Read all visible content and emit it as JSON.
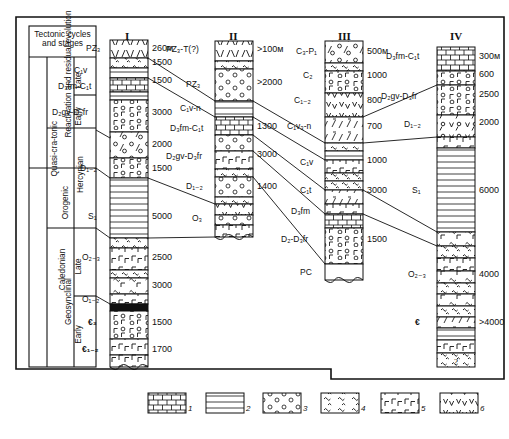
{
  "diagram": {
    "title_box": "Tectonic cycles and stages",
    "tectonic_table": {
      "cycles": [
        {
          "name": "Hercynian"
        },
        {
          "name": "Caledonian"
        }
      ],
      "stages": [
        {
          "name": "Reactivation and residual evolution"
        },
        {
          "name": "Quasi-cra-tonic"
        },
        {
          "name": "Orogenic"
        },
        {
          "name": "Geosynclinal"
        }
      ],
      "substages": [
        "Late",
        "Early",
        "Late",
        "Early"
      ]
    },
    "columns": [
      {
        "header": "I",
        "units": [
          {
            "label": "PZ₃",
            "thickness": "260м"
          },
          {
            "label": "",
            "thickness": "1500"
          },
          {
            "label": "",
            "thickness": "1500"
          },
          {
            "label": "C₁v",
            "thickness": ""
          },
          {
            "label": "D₃fm-C₁t",
            "thickness": ""
          },
          {
            "label": "D₂gv-D₃fr",
            "thickness": "3000"
          },
          {
            "label": "",
            "thickness": "2000"
          },
          {
            "label": "D₁₋₂",
            "thickness": "1500"
          },
          {
            "label": "S₁",
            "thickness": "5000"
          },
          {
            "label": "O₂₋₃",
            "thickness": "2500"
          },
          {
            "label": "O₁₋₂",
            "thickness": "3000"
          },
          {
            "label": "€₃",
            "thickness": "1500"
          },
          {
            "label": "€₁₋₂",
            "thickness": "1700"
          }
        ]
      },
      {
        "header": "II",
        "units": [
          {
            "label": "PZ₃-T(?)",
            "thickness": ">100м"
          },
          {
            "label": "PZ₃",
            "thickness": ">2000"
          },
          {
            "label": "C₁v-n",
            "thickness": ""
          },
          {
            "label": "D₃fm-C₁t",
            "thickness": "1300"
          },
          {
            "label": "D₂gv-D₃fr",
            "thickness": "3000"
          },
          {
            "label": "D₁₋₂",
            "thickness": "1400"
          },
          {
            "label": "O₃",
            "thickness": ""
          }
        ]
      },
      {
        "header": "III",
        "units": [
          {
            "label": "C₃-P₁",
            "thickness": "500м"
          },
          {
            "label": "C₂",
            "thickness": "1000"
          },
          {
            "label": "C₁₋₂",
            "thickness": "800"
          },
          {
            "label": "C₁v₃-n",
            "thickness": "700"
          },
          {
            "label": "C₁v",
            "thickness": "1000"
          },
          {
            "label": "C₁t",
            "thickness": "3000"
          },
          {
            "label": "D₃fm",
            "thickness": ""
          },
          {
            "label": "D₂-D₃fr",
            "thickness": "1500"
          },
          {
            "label": "PC",
            "thickness": ""
          }
        ]
      },
      {
        "header": "IV",
        "units": [
          {
            "label": "D₃fm-C₁t",
            "thickness": "300м"
          },
          {
            "label": "",
            "thickness": "600"
          },
          {
            "label": "D₂gv-D₃fr",
            "thickness": "2500"
          },
          {
            "label": "D₁₋₂",
            "thickness": "2000"
          },
          {
            "label": "S₁",
            "thickness": "6000"
          },
          {
            "label": "O₂₋₃",
            "thickness": "4000"
          },
          {
            "label": "€",
            "thickness": ">4000"
          }
        ]
      }
    ],
    "legend": {
      "items": [
        {
          "id": "1",
          "pattern": "limestone-brick"
        },
        {
          "id": "2",
          "pattern": "horizontal-lines"
        },
        {
          "id": "3",
          "pattern": "conglomerate-circles"
        },
        {
          "id": "4",
          "pattern": "squiggle-marl"
        },
        {
          "id": "5",
          "pattern": "gamma-hooks"
        },
        {
          "id": "6",
          "pattern": "vee-volcanic"
        }
      ]
    }
  }
}
